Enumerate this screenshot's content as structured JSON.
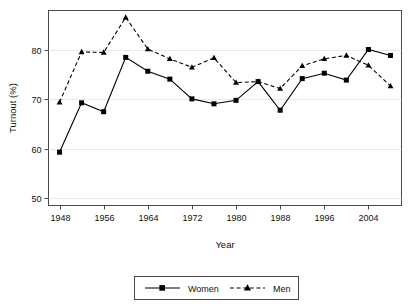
{
  "chart_data": {
    "type": "line",
    "title": "",
    "xlabel": "Year",
    "ylabel": "Turnout (%)",
    "xlim": [
      1946,
      2010
    ],
    "ylim": [
      48.5,
      88
    ],
    "grid": true,
    "grid_axis": "y",
    "legend_position": "bottom",
    "xticks": [
      1948,
      1956,
      1964,
      1972,
      1980,
      1988,
      1996,
      2004
    ],
    "xtick_labels": [
      "1948",
      "1956",
      "1964",
      "1972",
      "1980",
      "1988",
      "1996",
      "2004"
    ],
    "yticks": [
      50,
      60,
      70,
      80
    ],
    "ytick_labels": [
      "50",
      "60",
      "70",
      "80"
    ],
    "x": [
      1948,
      1950,
      1952,
      1954,
      1956,
      1958,
      1960,
      1962,
      1964,
      1966,
      1968,
      1970,
      1972,
      1974,
      1976,
      1978,
      1980,
      1982,
      1984,
      1986,
      1988,
      1990,
      1992,
      1994,
      1996,
      1998,
      2000,
      2002,
      2004,
      2006,
      2008
    ],
    "series": [
      {
        "name": "Women",
        "marker": "square",
        "linestyle": "solid",
        "color": "#000000",
        "values": [
          59.3,
          69.3,
          69.3,
          67.5,
          67.5,
          78.5,
          78.5,
          75.7,
          75.7,
          74.1,
          74.1,
          70.1,
          70.1,
          69.1,
          69.1,
          69.8,
          69.8,
          73.6,
          73.6,
          67.8,
          67.8,
          74.2,
          74.2,
          75.3,
          75.3,
          73.9,
          73.9,
          80.1,
          80.1,
          78.9,
          78.9
        ]
      },
      {
        "name": "Men",
        "marker": "triangle",
        "linestyle": "dashed",
        "color": "#000000",
        "values": [
          69.4,
          79.6,
          79.6,
          79.5,
          79.5,
          86.6,
          86.6,
          80.2,
          80.2,
          78.2,
          78.2,
          76.5,
          76.5,
          78.4,
          78.4,
          73.4,
          73.4,
          73.6,
          73.6,
          72.2,
          72.2,
          76.8,
          76.8,
          78.2,
          78.2,
          78.9,
          78.9,
          76.9,
          76.9,
          72.7,
          72.7
        ]
      }
    ],
    "series_points": {
      "Women": [
        {
          "x": 1948,
          "y": 59.3
        },
        {
          "x": 1952,
          "y": 69.3
        },
        {
          "x": 1956,
          "y": 67.5
        },
        {
          "x": 1960,
          "y": 78.5
        },
        {
          "x": 1964,
          "y": 75.7
        },
        {
          "x": 1968,
          "y": 74.1
        },
        {
          "x": 1972,
          "y": 70.1
        },
        {
          "x": 1976,
          "y": 69.1
        },
        {
          "x": 1980,
          "y": 69.8
        },
        {
          "x": 1984,
          "y": 73.6
        },
        {
          "x": 1988,
          "y": 67.8
        },
        {
          "x": 1992,
          "y": 74.2
        },
        {
          "x": 1996,
          "y": 75.3
        },
        {
          "x": 2000,
          "y": 73.9
        },
        {
          "x": 2004,
          "y": 80.1
        },
        {
          "x": 2008,
          "y": 78.9
        }
      ],
      "Men": [
        {
          "x": 1948,
          "y": 69.4
        },
        {
          "x": 1952,
          "y": 79.6
        },
        {
          "x": 1956,
          "y": 79.5
        },
        {
          "x": 1960,
          "y": 86.6
        },
        {
          "x": 1964,
          "y": 80.2
        },
        {
          "x": 1968,
          "y": 78.2
        },
        {
          "x": 1972,
          "y": 76.5
        },
        {
          "x": 1976,
          "y": 78.4
        },
        {
          "x": 1980,
          "y": 73.4
        },
        {
          "x": 1984,
          "y": 73.6
        },
        {
          "x": 1988,
          "y": 72.2
        },
        {
          "x": 1992,
          "y": 76.8
        },
        {
          "x": 1996,
          "y": 78.2
        },
        {
          "x": 2000,
          "y": 78.9
        },
        {
          "x": 2004,
          "y": 76.9
        },
        {
          "x": 2008,
          "y": 72.7
        }
      ]
    },
    "legend_entries": [
      {
        "label": "Women",
        "marker": "square",
        "linestyle": "solid"
      },
      {
        "label": "Men",
        "marker": "triangle",
        "linestyle": "dashed"
      }
    ]
  }
}
